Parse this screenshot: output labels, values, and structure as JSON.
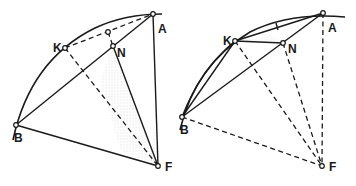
{
  "figure": {
    "left": {
      "labels": {
        "A": "A",
        "B": "B",
        "K": "K",
        "N": "N",
        "F": "F"
      },
      "points": {
        "A": [
          153,
          14
        ],
        "B": [
          16,
          125
        ],
        "K": [
          65,
          48
        ],
        "N": [
          113,
          46
        ],
        "F": [
          158,
          166
        ],
        "M": [
          108,
          32
        ]
      },
      "solid_segments": [
        [
          "B",
          "A"
        ],
        [
          "A",
          "F"
        ],
        [
          "B",
          "F"
        ],
        [
          "N",
          "F"
        ],
        [
          "M",
          "N"
        ]
      ],
      "dashed_segments": [
        [
          "K",
          "A"
        ],
        [
          "K",
          "F"
        ]
      ],
      "shaded_region": "triangle N-F near BF (stippled)"
    },
    "right": {
      "labels": {
        "A": "A",
        "B": "B",
        "K": "K",
        "N": "N",
        "F": "F"
      },
      "points": {
        "A": [
          323,
          13
        ],
        "B": [
          182,
          117
        ],
        "K": [
          235,
          41
        ],
        "N": [
          283,
          43
        ],
        "F": [
          322,
          166
        ]
      },
      "solid_segments": [
        [
          "B",
          "A"
        ],
        [
          "K",
          "A"
        ],
        [
          "B",
          "K"
        ],
        [
          "K",
          "N"
        ]
      ],
      "dashed_segments": [
        [
          "A",
          "F"
        ],
        [
          "B",
          "F"
        ],
        [
          "K",
          "F"
        ],
        [
          "N",
          "F"
        ]
      ],
      "tick_marks": [
        "on K-A chord near midpoint"
      ]
    },
    "colors": {
      "ink": "#1a1a1a",
      "background": "#ffffff",
      "stipple": "#b0b0b0"
    }
  }
}
